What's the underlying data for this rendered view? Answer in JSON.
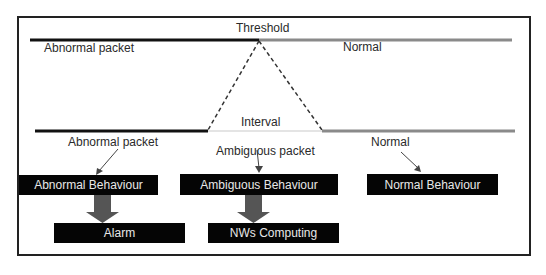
{
  "diagram": {
    "threshold_label": "Threshold",
    "top_left_label": "Abnormal packet",
    "top_right_label": "Normal",
    "interval_label": "Interval",
    "bottom_left_label": "Abnormal packet",
    "bottom_middle_label": "Ambiguous packet",
    "bottom_right_label": "Normal",
    "boxes": {
      "abnormal_behaviour": "Abnormal Behaviour",
      "ambiguous_behaviour": "Ambiguous Behaviour",
      "normal_behaviour": "Normal Behaviour",
      "alarm": "Alarm",
      "nws_computing": "NWs Computing"
    },
    "colors": {
      "abnormal_line": "#111111",
      "normal_line": "#8a8a8a",
      "box_fill": "#050505",
      "box_text": "#e8e8e8",
      "thick_arrow": "#555555"
    }
  }
}
